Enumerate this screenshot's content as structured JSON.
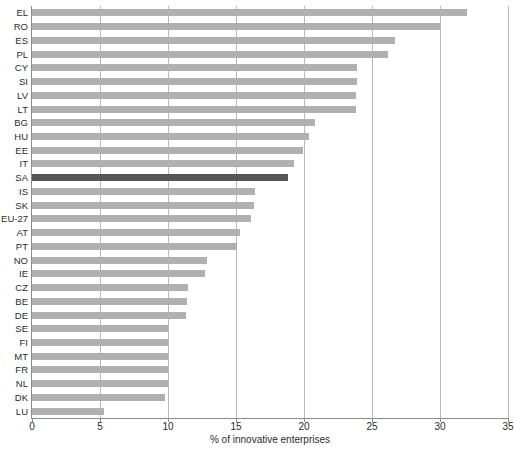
{
  "chart_data": {
    "type": "bar",
    "orientation": "horizontal",
    "title": "",
    "xlabel": "% of innovative enterprises",
    "ylabel": "",
    "xlim": [
      0,
      35
    ],
    "xticks": [
      0,
      5,
      10,
      15,
      20,
      25,
      30,
      35
    ],
    "grid": true,
    "legend": false,
    "highlight_category": "SA",
    "colors": {
      "bar": "#b0b0b0",
      "highlight": "#565656",
      "gridline": "#b9b9b9",
      "axis": "#8c8c8c",
      "text": "#2b2b2b"
    },
    "categories": [
      "EL",
      "RO",
      "ES",
      "PL",
      "CY",
      "SI",
      "LV",
      "LT",
      "BG",
      "HU",
      "EE",
      "IT",
      "SA",
      "IS",
      "SK",
      "EU-27",
      "AT",
      "PT",
      "NO",
      "IE",
      "CZ",
      "BE",
      "DE",
      "SE",
      "FI",
      "MT",
      "FR",
      "NL",
      "DK",
      "LU"
    ],
    "values": [
      32.0,
      30.0,
      26.7,
      26.2,
      23.9,
      23.9,
      23.8,
      23.8,
      20.8,
      20.4,
      19.9,
      19.3,
      18.8,
      16.4,
      16.3,
      16.1,
      15.3,
      15.1,
      12.9,
      12.7,
      11.5,
      11.4,
      11.3,
      10.0,
      10.0,
      10.0,
      10.0,
      10.0,
      9.8,
      5.3
    ]
  }
}
